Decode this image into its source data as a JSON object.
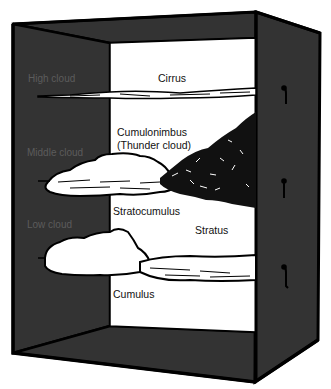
{
  "diagram": {
    "type": "cloud-types-by-altitude-box",
    "colors": {
      "wall": "#333333",
      "outline": "#000000",
      "background": "#ffffff",
      "wall_label": "#5c5c5c",
      "cloud_fill": "#ffffff",
      "thundercloud": "#111111"
    },
    "altitude_labels": {
      "high": "High cloud",
      "middle": "Middle cloud",
      "low": "Low cloud"
    },
    "cloud_labels": {
      "cirrus": "Cirrus",
      "cumulonimbus": "Cumulonimbus",
      "cumulonimbus_note": "(Thunder cloud)",
      "stratocumulus": "Stratocumulus",
      "stratus": "Stratus",
      "cumulus": "Cumulus"
    },
    "hooks": 3
  }
}
